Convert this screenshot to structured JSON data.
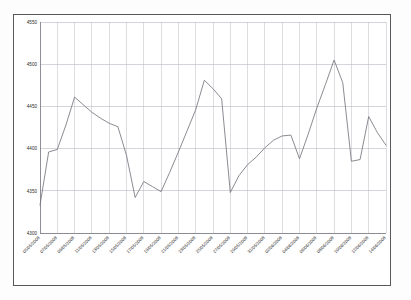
{
  "chart_data": {
    "type": "line",
    "title": "",
    "subtitle": "",
    "xlabel": "",
    "ylabel": "",
    "ylim": [
      4300,
      4550
    ],
    "yticks": [
      4300,
      4350,
      4400,
      4450,
      4500,
      4550
    ],
    "ytick_labels": [
      "4300",
      "4350",
      "4400",
      "4450",
      "4500",
      "4550"
    ],
    "grid": true,
    "legend": null,
    "legend_position": "none",
    "series_name": "",
    "series_color": "#76767e",
    "categories": [
      "05/05/2008",
      "06/05/2008",
      "07/05/2008",
      "08/05/2008",
      "09/05/2008",
      "10/05/2008",
      "11/05/2008",
      "12/05/2008",
      "13/05/2008",
      "14/05/2008",
      "15/05/2008",
      "16/05/2008",
      "17/05/2008",
      "18/05/2008",
      "19/05/2008",
      "20/05/2008",
      "21/05/2008",
      "22/05/2008",
      "23/05/2008",
      "24/05/2008",
      "25/05/2008",
      "26/05/2008",
      "27/05/2008",
      "28/05/2008",
      "29/05/2008",
      "30/05/2008",
      "31/05/2008",
      "01/06/2008",
      "02/06/2008",
      "03/06/2008",
      "04/06/2008",
      "05/06/2008",
      "06/06/2008",
      "07/06/2008",
      "08/06/2008",
      "09/06/2008",
      "10/06/2008",
      "11/06/2008",
      "12/06/2008",
      "13/06/2008",
      "14/06/2008"
    ],
    "xtick_labels": [
      "05/05/2008",
      "07/05/2008",
      "09/05/2008",
      "11/05/2008",
      "13/05/2008",
      "15/05/2008",
      "17/05/2008",
      "19/05/2008",
      "21/05/2008",
      "23/05/2008",
      "25/05/2008",
      "27/05/2008",
      "29/05/2008",
      "31/05/2008",
      "02/06/2008",
      "04/06/2008",
      "06/06/2008",
      "08/06/2008",
      "10/06/2008",
      "12/06/2008",
      "14/06/2008"
    ],
    "values": [
      4333,
      4396,
      4399,
      4428,
      4461,
      4452,
      4443,
      4436,
      4430,
      4426,
      4392,
      4342,
      4361,
      4355,
      4349,
      4372,
      4396,
      4421,
      4446,
      4481,
      4471,
      4459,
      4348,
      4368,
      4381,
      4390,
      4401,
      4410,
      4415,
      4416,
      4388,
      4417,
      4448,
      4476,
      4505,
      4478,
      4385,
      4387,
      4438,
      4419,
      4404
    ],
    "value_min": 4333,
    "value_max": 4505
  },
  "theme": {
    "background": "#ffffff",
    "page_background": "#fdfdfd",
    "frame_color": "#58585a",
    "gridline_color": "#b9b9c4",
    "axis_color": "#6e6e78",
    "line_color": "#76767e",
    "label_color": "#2b2b2b"
  }
}
